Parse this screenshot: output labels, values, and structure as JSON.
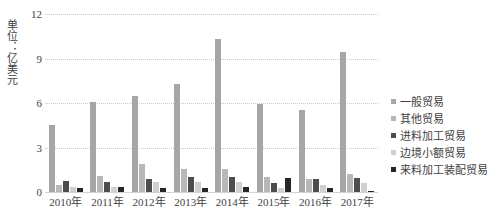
{
  "chart_data": {
    "type": "bar",
    "title": "",
    "subtitle": "",
    "xlabel": "",
    "ylabel": "单位：亿美元",
    "ylim": [
      0,
      12
    ],
    "yticks": [
      0,
      3,
      6,
      9,
      12
    ],
    "grid": true,
    "legend_position": "right",
    "categories": [
      "2010年",
      "2011年",
      "2012年",
      "2013年",
      "2014年",
      "2015年",
      "2016年",
      "2017年"
    ],
    "series": [
      {
        "name": "一般贸易",
        "color": "#a6a6a6",
        "values": [
          4.5,
          6.05,
          6.5,
          7.3,
          10.3,
          5.95,
          5.55,
          9.45
        ]
      },
      {
        "name": "其他贸易",
        "color": "#b8b8b8",
        "values": [
          0.5,
          1.1,
          1.9,
          1.55,
          1.55,
          1.0,
          0.85,
          1.2
        ]
      },
      {
        "name": "进料加工贸易",
        "color": "#4d4d4d",
        "values": [
          0.75,
          0.7,
          0.9,
          1.0,
          1.0,
          0.6,
          0.85,
          0.95
        ]
      },
      {
        "name": "边境小额贸易",
        "color": "#d0d0d0",
        "values": [
          0.35,
          0.35,
          0.7,
          0.7,
          0.7,
          0.3,
          0.45,
          0.6
        ]
      },
      {
        "name": "来料加工装配贸易",
        "color": "#262626",
        "values": [
          0.3,
          0.35,
          0.25,
          0.3,
          0.35,
          0.95,
          0.25,
          0.1
        ]
      }
    ]
  },
  "axis": {
    "y_title": "单位：亿美元",
    "y_tick_labels": [
      "12",
      "9",
      "6",
      "3",
      "0"
    ]
  },
  "legend": {
    "items": [
      {
        "label": "一般贸易",
        "color": "#a6a6a6"
      },
      {
        "label": "其他贸易",
        "color": "#b8b8b8"
      },
      {
        "label": "进料加工贸易",
        "color": "#4d4d4d"
      },
      {
        "label": "边境小额贸易",
        "color": "#d0d0d0"
      },
      {
        "label": "来料加工装配贸易",
        "color": "#262626"
      }
    ]
  }
}
